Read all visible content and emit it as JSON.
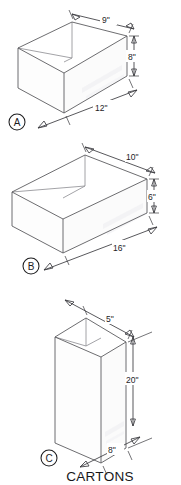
{
  "figure": {
    "caption": "CARTONS",
    "units_note": "inches",
    "stroke_color": "#5c5c60",
    "text_color": "#1d1d1f"
  },
  "cartons": [
    {
      "id": "A",
      "label": "A",
      "orientation": "open-top-box-wide",
      "dimensions": {
        "depth": "9\"",
        "height": "8\"",
        "width": "12\""
      }
    },
    {
      "id": "B",
      "label": "B",
      "orientation": "open-top-box-wide",
      "dimensions": {
        "depth": "10\"",
        "height": "6\"",
        "width": "16\""
      }
    },
    {
      "id": "C",
      "label": "C",
      "orientation": "open-top-box-tall",
      "dimensions": {
        "depth": "5\"",
        "height": "20\"",
        "width": "8\""
      }
    }
  ]
}
